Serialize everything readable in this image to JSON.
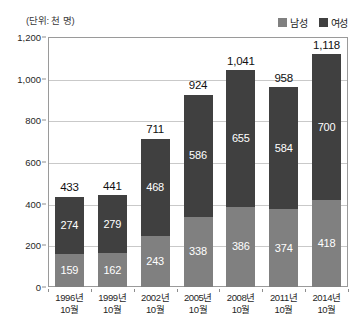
{
  "figure": {
    "unit_caption": "(단위: 천 명)"
  },
  "legend": {
    "position": "top-right",
    "entries": [
      {
        "label": "남성",
        "color": "#808080",
        "swatch_icon": "square-swatch-icon"
      },
      {
        "label": "여성",
        "color": "#404040",
        "swatch_icon": "square-swatch-icon"
      }
    ]
  },
  "colors": {
    "male": "#808080",
    "female": "#404040",
    "grid": "#c9c9c9",
    "frame": "#9a9a9a",
    "text": "#1f1f1f",
    "segment_label": "#ffffff"
  },
  "axes": {
    "y_ticks": [
      "0",
      "200",
      "400",
      "600",
      "800",
      "1,000",
      "1,200"
    ],
    "y_tick_values": [
      0,
      200,
      400,
      600,
      800,
      1000,
      1200
    ],
    "y_min": 0,
    "y_max": 1200,
    "grid": true
  },
  "chart_data": {
    "type": "bar",
    "stacked": true,
    "title": "",
    "subtitle": "",
    "xlabel": "",
    "ylabel": "",
    "unit": "(단위: 천 명)",
    "ylim": [
      0,
      1200
    ],
    "grid": true,
    "legend_position": "top-right",
    "categories": [
      "1996년 10월",
      "1999년 10월",
      "2002년 10월",
      "2005년 10월",
      "2008년 10월",
      "2011년 10월",
      "2014년 10월"
    ],
    "category_lines": [
      [
        "1996년",
        "10월"
      ],
      [
        "1999년",
        "10월"
      ],
      [
        "2002년",
        "10월"
      ],
      [
        "2005년",
        "10월"
      ],
      [
        "2008년",
        "10월"
      ],
      [
        "2011년",
        "10월"
      ],
      [
        "2014년",
        "10월"
      ]
    ],
    "series": [
      {
        "name": "남성",
        "color": "#808080",
        "values": [
          159,
          162,
          243,
          338,
          386,
          374,
          418
        ],
        "labels": [
          "159",
          "162",
          "243",
          "338",
          "386",
          "374",
          "418"
        ]
      },
      {
        "name": "여성",
        "color": "#404040",
        "values": [
          274,
          279,
          468,
          586,
          655,
          584,
          700
        ],
        "labels": [
          "274",
          "279",
          "468",
          "586",
          "655",
          "584",
          "700"
        ]
      }
    ],
    "totals": [
      433,
      441,
      711,
      924,
      1041,
      958,
      1118
    ],
    "total_labels": [
      "433",
      "441",
      "711",
      "924",
      "1,041",
      "958",
      "1,118"
    ]
  }
}
